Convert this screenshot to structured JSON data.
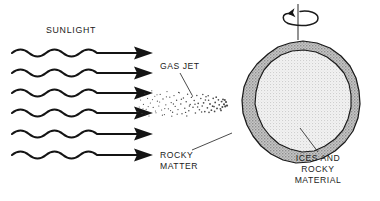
{
  "diagram": {
    "background_color": "#ffffff",
    "width": 380,
    "height": 201
  },
  "labels": {
    "sunlight": "SUNLIGHT",
    "gas_jet": "GAS JET",
    "rocky_matter_line1": "ROCKY",
    "rocky_matter_line2": "MATTER",
    "ices_line1": "ICES AND",
    "ices_line2": "ROCKY",
    "ices_line3": "MATERIAL"
  },
  "sunlight_rays": {
    "count": 6,
    "direction": "left-to-right",
    "wave_cycles": 4,
    "y_positions": [
      53,
      73,
      93,
      113,
      134,
      155
    ],
    "x_start": 12,
    "x_tip": 152,
    "stroke_color": "#141414"
  },
  "gas_jet": {
    "origin_x": 228,
    "origin_y": 104,
    "spread_direction": "leftward",
    "particle_count": 190,
    "particle_color": "#4a4a4a"
  },
  "nucleus": {
    "center_x": 298,
    "center_y": 105,
    "crust_color": "#b9b9b9",
    "core_color": "#ececec",
    "outline_color": "#1a1a1a",
    "crust_label": "ICES AND ROCKY MATERIAL",
    "core_label": "ROCKY MATTER"
  },
  "rotation": {
    "axis_x": 298,
    "axis_top_y": 4,
    "axis_bottom_y": 38,
    "arrow_direction": "counterclockwise",
    "symbol": "rotation-arrow"
  }
}
